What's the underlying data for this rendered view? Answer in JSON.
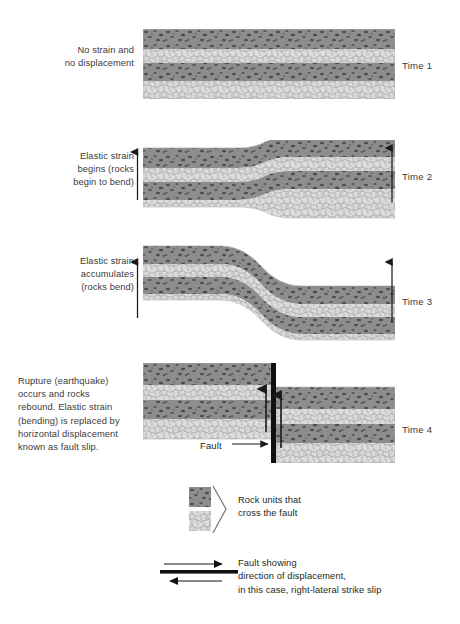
{
  "figure": {
    "colors": {
      "dark_unit": "#8a8a8a",
      "dark_speckle": "#4a4a4a",
      "light_unit": "#d9d9d9",
      "light_outline": "#9a9a9a",
      "fault_line": "#111111",
      "text": "#3c3a3b",
      "legend_text": "#231f20",
      "background": "#ffffff"
    }
  },
  "stages": [
    {
      "id": "time-1",
      "description": "No strain and\nno displacement",
      "desc_line1": "No strain and",
      "desc_line2": "no displacement",
      "time_label": "Time 1",
      "left_arrow": false,
      "right_arrow": false,
      "bend": "none"
    },
    {
      "id": "time-2",
      "description": "Elastic strain\nbegins (rocks\nbegin to bend)",
      "desc_line1": "Elastic strain",
      "desc_line2": "begins (rocks",
      "desc_line3": "begin to bend)",
      "time_label": "Time 2",
      "left_arrow": true,
      "left_arrow_direction": "up",
      "right_arrow": true,
      "right_arrow_direction": "down",
      "bend": "slight"
    },
    {
      "id": "time-3",
      "description": "Elastic strain\naccumulates\n(rocks bend)",
      "desc_line1": "Elastic strain",
      "desc_line2": "accumulates",
      "desc_line3": "(rocks bend)",
      "time_label": "Time 3",
      "left_arrow": true,
      "left_arrow_direction": "up",
      "right_arrow": true,
      "right_arrow_direction": "down",
      "bend": "strong"
    },
    {
      "id": "time-4",
      "description": "Rupture (earthquake)\noccurs and rocks\nrebound. Elastic strain\n(bending) is replaced by\nhorizontal displacement\nknown as fault slip.",
      "desc_line1": "Rupture (earthquake)",
      "desc_line2": "occurs and rocks",
      "desc_line3": "rebound. Elastic strain",
      "desc_line4": "(bending) is replaced by",
      "desc_line5": "horizontal displacement",
      "desc_line6": "known as fault slip.",
      "time_label": "Time 4",
      "fault_label": "Fault",
      "left_arrow": true,
      "left_arrow_direction": "up",
      "right_arrow": true,
      "right_arrow_direction": "down",
      "bend": "ruptured"
    }
  ],
  "legend_units": {
    "line1": "Rock units that",
    "line2": "cross the fault"
  },
  "legend_fault": {
    "line1": "Fault showing",
    "line2": "direction of displacement,",
    "line3": "in this case, right-lateral strike slip"
  }
}
